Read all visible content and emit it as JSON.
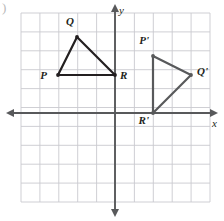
{
  "figure": {
    "type": "coordinate-plane-geometry",
    "corner_mark": ")",
    "background": "#ffffff",
    "grid": {
      "color": "#c9c9cf",
      "x_min_px": 21,
      "x_max_px": 210,
      "y_min_px": 13,
      "y_max_px": 202,
      "cell_px": 18.9,
      "columns": 10,
      "rows": 10,
      "visible": true
    },
    "axes": {
      "color": "#58595b",
      "x_axis": {
        "label": "x",
        "label_pos": {
          "x": 212,
          "y": 118
        },
        "y_px": 113,
        "start_px": 8,
        "end_px": 216,
        "arrows": "both"
      },
      "y_axis": {
        "label": "y",
        "label_pos": {
          "x": 119,
          "y": 5
        },
        "x_px": 115,
        "start_px": 6,
        "end_px": 215,
        "arrows": "both"
      },
      "origin_px": {
        "x": 115,
        "y": 113
      },
      "unit_px": 18.9
    }
  },
  "chart_data": {
    "type": "scatter",
    "title": "",
    "xlabel": "x",
    "ylabel": "y",
    "xlim": [
      -5,
      5
    ],
    "ylim": [
      -5,
      5
    ],
    "grid": true,
    "legend": "none",
    "shapes": [
      {
        "name": "triangle-PQR",
        "kind": "triangle",
        "stroke": "#231f20",
        "stroke_width": 2.2,
        "vertices": [
          {
            "label": "P",
            "x": -3,
            "y": 2,
            "px": 58,
            "py": 75,
            "label_dx": -11,
            "label_dy": 3
          },
          {
            "label": "Q",
            "x": -2,
            "y": 4,
            "px": 77,
            "py": 37,
            "label_dx": -3,
            "label_dy": -13
          },
          {
            "label": "R",
            "x": 0,
            "y": 2,
            "px": 115,
            "py": 75,
            "label_dx": 5,
            "label_dy": 3
          }
        ]
      },
      {
        "name": "triangle-P-prime-Q-prime-R-prime",
        "kind": "triangle",
        "stroke": "#58595b",
        "stroke_width": 2.2,
        "vertices": [
          {
            "label": "P'",
            "x": 2,
            "y": 3,
            "px": 153,
            "py": 56,
            "label_dx": -4,
            "label_dy": -13
          },
          {
            "label": "Q'",
            "x": 4,
            "y": 2,
            "px": 191,
            "py": 75,
            "label_dx": 6,
            "label_dy": -1
          },
          {
            "label": "R'",
            "x": 2,
            "y": 0,
            "px": 153,
            "py": 113,
            "label_dx": -4,
            "label_dy": 10
          }
        ]
      }
    ],
    "annotations": [
      "P",
      "Q",
      "R",
      "P'",
      "Q'",
      "R'"
    ]
  }
}
